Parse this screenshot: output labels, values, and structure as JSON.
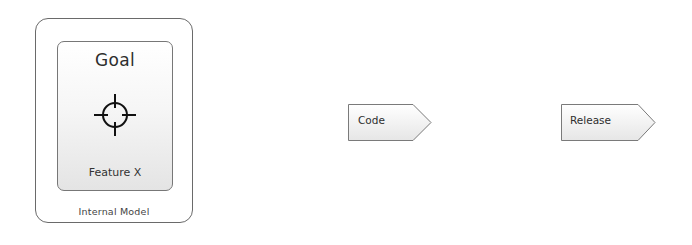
{
  "diagram": {
    "internal_model": {
      "label": "Internal Model",
      "goal": {
        "title": "Goal",
        "icon": "crosshair-target-icon",
        "feature": "Feature X"
      }
    },
    "steps": [
      {
        "label": "Code",
        "shape": "pentagon-arrow"
      },
      {
        "label": "Release",
        "shape": "pentagon-arrow"
      }
    ],
    "colors": {
      "stroke": "#6a6a6a",
      "fill_top": "#ffffff",
      "fill_bottom": "#e4e4e4",
      "text": "#333333"
    }
  }
}
